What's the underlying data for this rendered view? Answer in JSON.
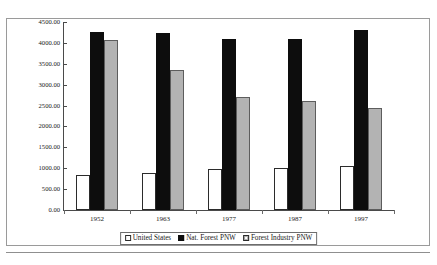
{
  "chart_data": {
    "type": "bar",
    "title": "",
    "xlabel": "",
    "ylabel": "Timber Volume per Acre (cu. ft)",
    "categories": [
      "1952",
      "1963",
      "1977",
      "1987",
      "1997"
    ],
    "series": [
      {
        "name": "United States",
        "color": "#ffffff",
        "values": [
          850,
          880,
          980,
          1000,
          1050
        ]
      },
      {
        "name": "Nat. Forest PNW",
        "color": "#0d0d0d",
        "values": [
          4250,
          4230,
          4100,
          4090,
          4300
        ]
      },
      {
        "name": "Forest Industry PNW",
        "color": "#b3b3b3",
        "values": [
          4060,
          3350,
          2700,
          2600,
          2450
        ]
      }
    ],
    "ylim": [
      0,
      4500
    ],
    "ytick_step": 500,
    "ytick_labels": [
      "0.00",
      "500.00",
      "1000.00",
      "1500.00",
      "2000.00",
      "2500.00",
      "3000.00",
      "3500.00",
      "4000.00",
      "4500.00"
    ],
    "grid": false,
    "legend_position": "bottom",
    "legend_entries": [
      "United States",
      "Nat. Forest PNW",
      "Forest Industry PNW"
    ]
  }
}
